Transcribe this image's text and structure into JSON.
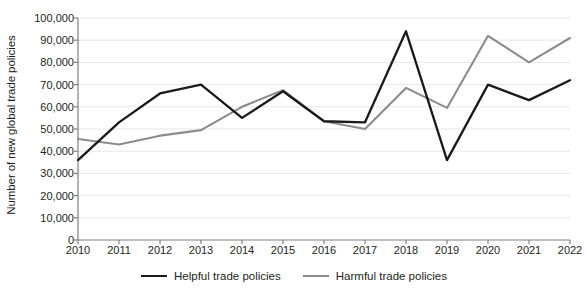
{
  "chart_data": {
    "type": "line",
    "title": "",
    "xlabel": "",
    "ylabel": "Number of new global trade policies",
    "categories": [
      "2010",
      "2011",
      "2012",
      "2013",
      "2014",
      "2015",
      "2016",
      "2017",
      "2018",
      "2019",
      "2020",
      "2021",
      "2022"
    ],
    "x": [
      2010,
      2011,
      2012,
      2013,
      2014,
      2015,
      2016,
      2017,
      2018,
      2019,
      2020,
      2021,
      2022
    ],
    "series": [
      {
        "name": "Helpful trade policies",
        "color": "#1a1a1a",
        "values": [
          36000,
          53000,
          66000,
          70000,
          55000,
          67000,
          53500,
          53000,
          94000,
          36000,
          70000,
          63000,
          72000
        ]
      },
      {
        "name": "Harmful trade policies",
        "color": "#8c8c8c",
        "values": [
          45500,
          43000,
          47000,
          49500,
          60000,
          67500,
          53500,
          50000,
          68500,
          59500,
          92000,
          80000,
          91000
        ]
      }
    ],
    "ylim": [
      0,
      100000
    ],
    "yticks": [
      0,
      10000,
      20000,
      30000,
      40000,
      50000,
      60000,
      70000,
      80000,
      90000,
      100000
    ],
    "ytick_labels": [
      "0",
      "10,000",
      "20,000",
      "30,000",
      "40,000",
      "50,000",
      "60,000",
      "70,000",
      "80,000",
      "90,000",
      "100,000"
    ],
    "grid": true,
    "grid_color": "#e6e6e6",
    "legend_position": "bottom",
    "legend": [
      "Helpful trade policies",
      "Harmful trade policies"
    ]
  }
}
